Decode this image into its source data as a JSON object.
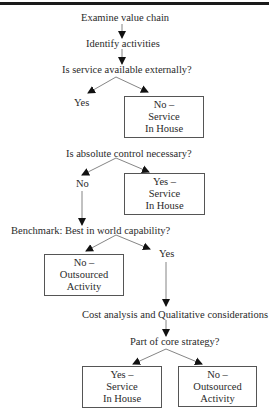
{
  "diagram": {
    "type": "flowchart",
    "nodes": {
      "start": "Examine value chain",
      "identify": "Identify activities",
      "q1": "Is service available externally?",
      "q1_yes": "Yes",
      "q1_no": {
        "line1": "No –",
        "line2": "Service",
        "line3": "In House"
      },
      "q2": "Is absolute control necessary?",
      "q2_no": "No",
      "q2_yes": {
        "line1": "Yes –",
        "line2": "Service",
        "line3": "In House"
      },
      "q3": "Benchmark: Best in world capability?",
      "q3_no": {
        "line1": "No –",
        "line2": "Outsourced",
        "line3": "Activity"
      },
      "q3_yes": "Yes",
      "analysis": "Cost analysis and Qualitative considerations",
      "q4": "Part of core strategy?",
      "q4_yes": {
        "line1": "Yes –",
        "line2": "Service",
        "line3": "In House"
      },
      "q4_no": {
        "line1": "No –",
        "line2": "Outsourced",
        "line3": "Activity"
      }
    },
    "edges": [
      [
        "start",
        "identify"
      ],
      [
        "identify",
        "q1"
      ],
      [
        "q1",
        "q1_yes"
      ],
      [
        "q1",
        "q1_no"
      ],
      [
        "q2",
        "q2_no"
      ],
      [
        "q2",
        "q2_yes"
      ],
      [
        "q2_no",
        "q3"
      ],
      [
        "q3",
        "q3_no"
      ],
      [
        "q3",
        "q3_yes"
      ],
      [
        "q3_yes",
        "analysis"
      ],
      [
        "analysis",
        "q4"
      ],
      [
        "q4",
        "q4_yes"
      ],
      [
        "q4",
        "q4_no"
      ]
    ]
  }
}
